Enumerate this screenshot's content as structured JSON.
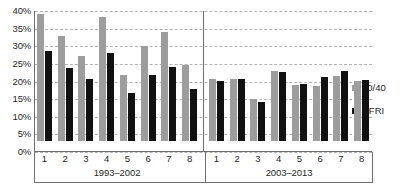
{
  "chart_data": {
    "type": "bar",
    "title": "",
    "subtitle": "",
    "xlabel": "",
    "ylabel": "",
    "ylim": [
      0,
      40
    ],
    "ytick_values": [
      0,
      5,
      10,
      15,
      20,
      25,
      30,
      35,
      40
    ],
    "ytick_labels": [
      "0%",
      "5%",
      "10%",
      "15%",
      "20%",
      "25%",
      "30%",
      "35%",
      "40%"
    ],
    "grid": true,
    "grid_axis": "y",
    "grid_style": "dashed",
    "legend_position": "right",
    "value_unit": "percent",
    "series_colors": {
      "60/40": "#9d9d9d",
      "HFRI": "#111111"
    },
    "legend": [
      {
        "name": "60/40",
        "color": "#9d9d9d"
      },
      {
        "name": "HFRI",
        "color": "#111111"
      }
    ],
    "panels": [
      {
        "caption": "1993–2002",
        "categories": [
          "1",
          "2",
          "3",
          "4",
          "5",
          "6",
          "7",
          "8"
        ],
        "series": [
          {
            "name": "60/40",
            "values": [
              36.0,
              29.8,
              24.2,
              35.2,
              18.8,
              27.0,
              30.8,
              21.5
            ]
          },
          {
            "name": "HFRI",
            "values": [
              25.5,
              20.8,
              17.5,
              25.0,
              13.5,
              18.8,
              21.0,
              14.8
            ]
          }
        ]
      },
      {
        "caption": "2003–2013",
        "categories": [
          "1",
          "2",
          "3",
          "4",
          "5",
          "6",
          "7",
          "8"
        ],
        "series": [
          {
            "name": "60/40",
            "values": [
              17.5,
              17.5,
              11.8,
              20.0,
              15.8,
              15.5,
              18.5,
              17.0
            ]
          },
          {
            "name": "HFRI",
            "values": [
              17.0,
              17.5,
              11.0,
              19.5,
              16.2,
              18.2,
              19.8,
              17.2
            ]
          }
        ]
      }
    ]
  }
}
